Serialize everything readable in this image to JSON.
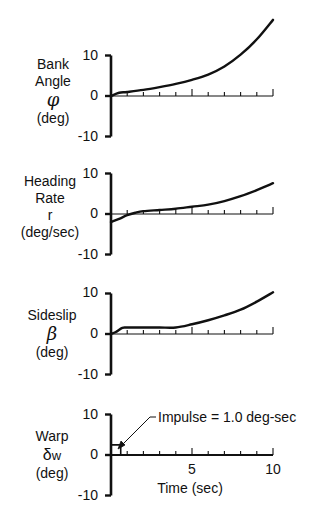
{
  "chart_data": [
    {
      "type": "line",
      "title": "",
      "ylabel_lines": [
        "Bank",
        "Angle",
        "φ",
        "(deg)"
      ],
      "xlabel": "",
      "ylim": [
        -10,
        10
      ],
      "xlim": [
        0,
        10
      ],
      "yticks": [
        "10",
        "0",
        "-10"
      ],
      "grid": false,
      "x": [
        0,
        0.5,
        1,
        2,
        3,
        4,
        5,
        6,
        7,
        8,
        9,
        10
      ],
      "values": [
        0,
        0.8,
        1.0,
        1.5,
        2.2,
        3.0,
        4.0,
        5.3,
        7.3,
        10.2,
        14.0,
        18.8
      ]
    },
    {
      "type": "line",
      "title": "",
      "ylabel_lines": [
        "Heading",
        "Rate",
        "r",
        "(deg/sec)"
      ],
      "xlabel": "",
      "ylim": [
        -10,
        10
      ],
      "xlim": [
        0,
        10
      ],
      "yticks": [
        "10",
        "0",
        "-10"
      ],
      "grid": false,
      "x": [
        0,
        0.5,
        1,
        1.5,
        2,
        3,
        4,
        5,
        6,
        7,
        8,
        9,
        10
      ],
      "values": [
        -2.0,
        -1.2,
        -0.3,
        0.3,
        0.7,
        1.0,
        1.3,
        1.8,
        2.3,
        3.2,
        4.4,
        5.9,
        7.6
      ]
    },
    {
      "type": "line",
      "title": "",
      "ylabel_lines": [
        "Sideslip",
        "β",
        "(deg)"
      ],
      "xlabel": "",
      "ylim": [
        -10,
        10
      ],
      "xlim": [
        0,
        10
      ],
      "yticks": [
        "10",
        "0",
        "-10"
      ],
      "grid": false,
      "x": [
        0,
        0.3,
        0.7,
        1,
        2,
        3,
        4,
        5,
        6,
        7,
        8,
        9,
        10
      ],
      "values": [
        0,
        0.5,
        1.5,
        1.6,
        1.6,
        1.6,
        1.6,
        2.4,
        3.4,
        4.6,
        6.0,
        8.0,
        10.3
      ]
    },
    {
      "type": "line",
      "title": "",
      "ylabel_lines": [
        "Warp",
        "δw",
        "(deg)"
      ],
      "xlabel": "Time (sec)",
      "ylim": [
        -10,
        10
      ],
      "xlim": [
        0,
        10
      ],
      "yticks": [
        "10",
        "0",
        "-10"
      ],
      "xticks": [
        "5",
        "10"
      ],
      "grid": false,
      "x": [
        0,
        0.1,
        0.6,
        0.6,
        10
      ],
      "values": [
        0,
        2.5,
        2.5,
        0,
        0
      ],
      "annotations": [
        {
          "text": "Impulse = 1.0 deg-sec",
          "x": 0.6,
          "y": 2.5
        }
      ]
    }
  ],
  "panels": [
    {
      "label_lines": [
        "Bank",
        "Angle"
      ],
      "symbol": "φ",
      "units": "(deg)"
    },
    {
      "label_lines": [
        "Heading",
        "Rate"
      ],
      "symbol": "r",
      "units": "(deg/sec)"
    },
    {
      "label_lines": [
        "Sideslip"
      ],
      "symbol": "β",
      "units": "(deg)"
    },
    {
      "label_lines": [
        "Warp"
      ],
      "symbol": "δ",
      "symbol_sub": "w",
      "units": "(deg)"
    }
  ],
  "yticks": {
    "top": "10",
    "mid": "0",
    "bottom": "-10"
  },
  "xticks": {
    "five": "5",
    "ten": "10"
  },
  "xlabel": "Time (sec)",
  "annotation": "Impulse = 1.0 deg-sec"
}
